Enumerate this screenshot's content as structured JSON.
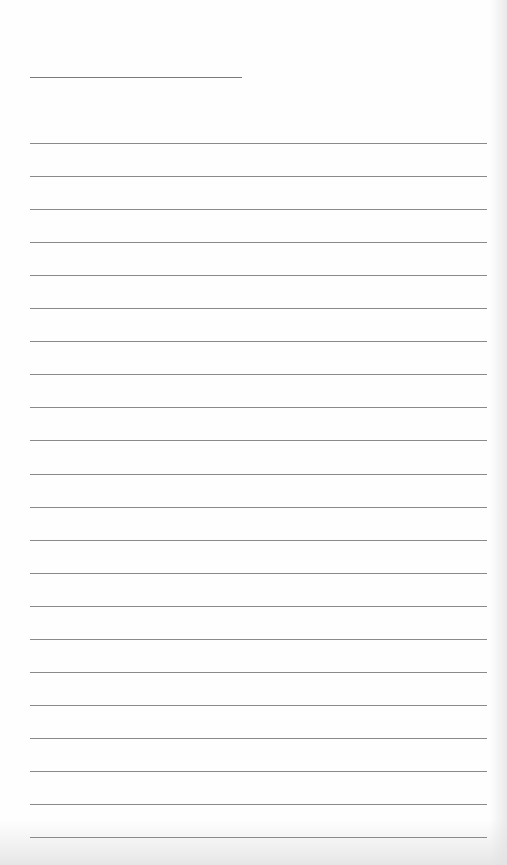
{
  "page": {
    "type": "lined-notepad",
    "title": "",
    "line_count": 22,
    "lines": [
      "",
      "",
      "",
      "",
      "",
      "",
      "",
      "",
      "",
      "",
      "",
      "",
      "",
      "",
      "",
      "",
      "",
      "",
      "",
      "",
      "",
      ""
    ]
  },
  "colors": {
    "paper": "#fefefe",
    "rule": "#8a8a8a",
    "title_rule": "#7a7a7a"
  }
}
